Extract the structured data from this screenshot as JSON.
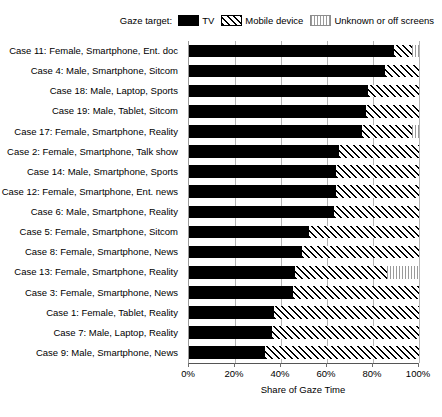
{
  "legend": {
    "title": "Gaze target:",
    "items": [
      {
        "label": "TV",
        "key": "tv",
        "color": "#000000",
        "swatch": "solid-black-swatch"
      },
      {
        "label": "Mobile device",
        "key": "mobile",
        "color": "#000000",
        "swatch": "diagonal-hatch-swatch"
      },
      {
        "label": "Unknown or off screens",
        "key": "unknown",
        "color": "#9a9a9a",
        "swatch": "grey-grid-hatch-swatch"
      }
    ]
  },
  "axis": {
    "x_title": "Share of Gaze Time",
    "x_ticks": [
      "0%",
      "20%",
      "40%",
      "60%",
      "80%",
      "100%"
    ],
    "x_tick_values": [
      0,
      20,
      40,
      60,
      80,
      100
    ]
  },
  "chart_data": {
    "type": "bar",
    "orientation": "horizontal",
    "stacked": true,
    "normalized": true,
    "title": "",
    "xlabel": "Share of Gaze Time",
    "ylabel": "",
    "xlim": [
      0,
      100
    ],
    "grid": true,
    "legend_position": "top-right",
    "series": [
      {
        "name": "TV",
        "values": [
          89,
          85,
          78,
          77,
          75,
          65,
          64,
          64,
          63,
          52,
          49,
          46,
          45,
          37,
          36,
          33
        ]
      },
      {
        "name": "Mobile device",
        "values": [
          8,
          15,
          22,
          23,
          22,
          35,
          36,
          36,
          37,
          48,
          51,
          40,
          55,
          63,
          64,
          67
        ]
      },
      {
        "name": "Unknown or off screens",
        "values": [
          3,
          0,
          0,
          0,
          3,
          0,
          0,
          0,
          0,
          0,
          0,
          14,
          0,
          0,
          0,
          0
        ]
      }
    ],
    "categories": [
      "Case 11: Female, Smartphone, Ent. doc",
      "Case 4: Male, Smartphone, Sitcom",
      "Case 18: Male, Laptop, Sports",
      "Case 19: Male, Tablet, Sitcom",
      "Case 17: Female, Smartphone, Reality",
      "Case 2: Female, Smartphone, Talk show",
      "Case 14: Male, Smartphone, Sports",
      "Case 12: Female, Smartphone, Ent. news",
      "Case 6: Male, Smartphone, Reality",
      "Case 5: Female, Smartphone, Sitcom",
      "Case 8: Female, Smartphone, News",
      "Case 13: Female, Smartphone, Reality",
      "Case 3: Female, Smartphone, News",
      "Case 1: Female, Tablet, Reality",
      "Case 7: Male, Laptop, Reality",
      "Case 9: Male, Smartphone, News"
    ]
  }
}
